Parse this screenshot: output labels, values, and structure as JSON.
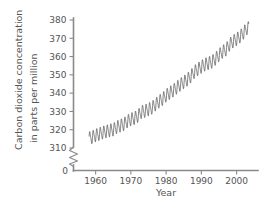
{
  "chart_data": {
    "type": "line",
    "title": "",
    "xlabel": "Year",
    "ylabel_line1": "Carbon dioxide concentration",
    "ylabel_line2": "in parts per million",
    "xlim": [
      1955,
      2005
    ],
    "ylim": [
      305,
      382
    ],
    "y_axis_break": true,
    "y_break_label": "0",
    "grid": false,
    "legend": "none",
    "line_color": "#5a5a5a",
    "axis_color": "#8a8a8a",
    "text_color": "#555555",
    "xticks": [
      1960,
      1970,
      1980,
      1990,
      2000
    ],
    "xtick_labels": [
      "1960",
      "1970",
      "1980",
      "1990",
      "2000"
    ],
    "yticks": [
      310,
      320,
      330,
      340,
      350,
      360,
      370,
      380
    ],
    "ytick_labels": [
      "310",
      "320",
      "330",
      "340",
      "350",
      "360",
      "370",
      "380"
    ],
    "series_name": "Mauna Loa CO2 monthly mean",
    "seasonal_amplitude_ppm": 3.2,
    "x_annual": [
      1958,
      1959,
      1960,
      1961,
      1962,
      1963,
      1964,
      1965,
      1966,
      1967,
      1968,
      1969,
      1970,
      1971,
      1972,
      1973,
      1974,
      1975,
      1976,
      1977,
      1978,
      1979,
      1980,
      1981,
      1982,
      1983,
      1984,
      1985,
      1986,
      1987,
      1988,
      1989,
      1990,
      1991,
      1992,
      1993,
      1994,
      1995,
      1996,
      1997,
      1998,
      1999,
      2000,
      2001,
      2002,
      2003
    ],
    "y_annual": [
      315.3,
      315.9,
      316.9,
      317.6,
      318.4,
      319.0,
      319.6,
      320.0,
      321.4,
      322.2,
      323.0,
      324.6,
      325.7,
      326.3,
      327.5,
      329.7,
      330.2,
      331.1,
      332.0,
      333.8,
      335.4,
      336.8,
      338.7,
      340.1,
      341.4,
      343.0,
      344.6,
      346.0,
      347.4,
      349.2,
      351.6,
      353.1,
      354.4,
      355.6,
      356.4,
      357.1,
      358.8,
      360.8,
      362.6,
      363.8,
      366.6,
      368.3,
      369.5,
      371.0,
      373.1,
      375.6
    ]
  },
  "figure": {
    "name": "keeling-curve-figure"
  }
}
